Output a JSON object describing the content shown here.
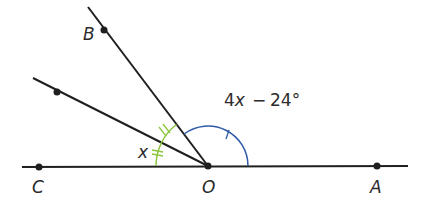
{
  "diagram": {
    "type": "angle-diagram",
    "colors": {
      "line": "#1f1f1f",
      "green_arc": "#8dc63f",
      "blue_arc": "#2e5aa8",
      "label": "#2b2b2b"
    },
    "points": {
      "B": {
        "label": "B"
      },
      "C": {
        "label": "C"
      },
      "O": {
        "label": "O"
      },
      "A": {
        "label": "A"
      }
    },
    "angle_labels": {
      "small_angle": "x",
      "obtuse_angle_expr": "4x",
      "obtuse_angle_minus": "−",
      "obtuse_angle_const": "24°"
    },
    "annotations": {
      "green_arcs": "two congruent angles marked with double ticks",
      "blue_arc": "angle AOB marked with single tick"
    }
  }
}
